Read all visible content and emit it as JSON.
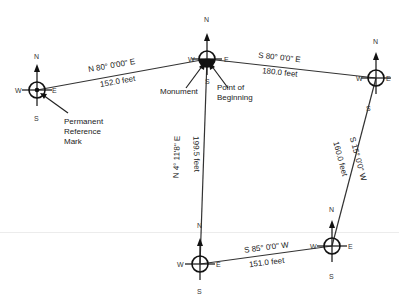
{
  "colors": {
    "line": "#333333",
    "text": "#222222",
    "background": "#ffffff"
  },
  "compass_letters": {
    "n": "N",
    "s": "S",
    "e": "E",
    "w": "W"
  },
  "points": {
    "reference_mark": {
      "label_lines": [
        "Permanent",
        "Reference",
        "Mark"
      ]
    },
    "monument": {
      "label": "Monument"
    },
    "point_of_beginning": {
      "label_lines": [
        "Point of",
        "Beginning"
      ]
    }
  },
  "courses": [
    {
      "bearing": "N 80° 0'00\" E",
      "distance": "152.0 feet"
    },
    {
      "bearing": "S 80° 0'0\" E",
      "distance": "180.0 feet"
    },
    {
      "bearing": "S 15° 0'0\" W",
      "distance": "160.0 feet"
    },
    {
      "bearing": "S 85° 0'0\" W",
      "distance": "151.0 feet"
    },
    {
      "bearing": "N  4°  11'8\"  E",
      "distance": "199.5  feet"
    }
  ]
}
